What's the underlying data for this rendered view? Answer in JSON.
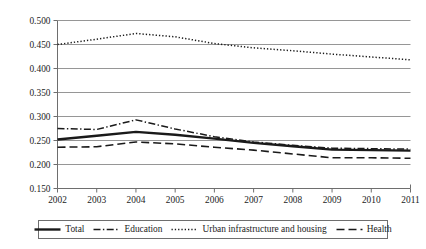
{
  "chart_data": {
    "type": "line",
    "title": "",
    "subtitle": "",
    "xlabel": "",
    "ylabel": "",
    "grid": true,
    "legend_position": "bottom",
    "categories": [
      "2002",
      "2003",
      "2004",
      "2005",
      "2006",
      "2007",
      "2008",
      "2009",
      "2010",
      "2011"
    ],
    "x": [
      2002,
      2003,
      2004,
      2005,
      2006,
      2007,
      2008,
      2009,
      2010,
      2011
    ],
    "xlim": [
      2002,
      2011
    ],
    "ylim": [
      0.15,
      0.5
    ],
    "ytick_labels": [
      "0.500",
      "0.450",
      "0.400",
      "0.350",
      "0.300",
      "0.250",
      "0.200",
      "0.150"
    ],
    "ytick_values": [
      0.5,
      0.45,
      0.4,
      0.35,
      0.3,
      0.25,
      0.2,
      0.15
    ],
    "series": [
      {
        "name": "Total",
        "style": "solid-thick",
        "color": "#1a1a1a",
        "values": [
          0.252,
          0.26,
          0.268,
          0.262,
          0.254,
          0.245,
          0.238,
          0.231,
          0.23,
          0.229
        ]
      },
      {
        "name": "Education",
        "style": "dash-dot",
        "color": "#1a1a1a",
        "values": [
          0.275,
          0.273,
          0.293,
          0.274,
          0.258,
          0.247,
          0.24,
          0.234,
          0.233,
          0.232
        ]
      },
      {
        "name": "Urban infrastructure and housing",
        "style": "dotted",
        "color": "#1a1a1a",
        "values": [
          0.45,
          0.461,
          0.473,
          0.466,
          0.452,
          0.443,
          0.437,
          0.43,
          0.424,
          0.418
        ]
      },
      {
        "name": "Health",
        "style": "long-dash",
        "color": "#1a1a1a",
        "values": [
          0.236,
          0.237,
          0.247,
          0.243,
          0.236,
          0.23,
          0.222,
          0.214,
          0.214,
          0.213
        ]
      }
    ]
  },
  "legend": {
    "entries": [
      {
        "label": "Total"
      },
      {
        "label": "Education"
      },
      {
        "label": "Urban infrastructure and housing"
      },
      {
        "label": "Health"
      }
    ]
  },
  "colors": {
    "ink": "#1a1a1a",
    "gridline": "#8a8a8a",
    "axis": "#6e6e6e",
    "background": "#ffffff"
  }
}
